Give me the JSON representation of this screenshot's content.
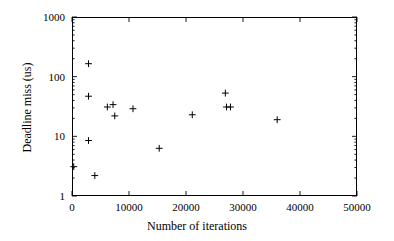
{
  "chart_data": {
    "type": "scatter",
    "title": "",
    "xlabel": "Number of iterations",
    "ylabel": "Deadline miss (us)",
    "xlim": [
      0,
      50000
    ],
    "ylim": [
      1,
      1000
    ],
    "yscale": "log",
    "xscale": "linear",
    "grid": false,
    "legend": null,
    "marker": "plus",
    "marker_color": "#000000",
    "xticks": [
      0,
      10000,
      20000,
      30000,
      40000,
      50000
    ],
    "xtick_labels": [
      "0",
      "10000",
      "20000",
      "30000",
      "40000",
      "50000"
    ],
    "yticks": [
      1,
      10,
      100,
      1000
    ],
    "ytick_labels": [
      "1",
      "10",
      "100",
      "1000"
    ],
    "minor_ticks": true,
    "points": [
      {
        "x": 300,
        "y": 3.1
      },
      {
        "x": 2900,
        "y": 165
      },
      {
        "x": 2900,
        "y": 47
      },
      {
        "x": 2900,
        "y": 8.5
      },
      {
        "x": 4000,
        "y": 2.2
      },
      {
        "x": 6200,
        "y": 31
      },
      {
        "x": 7200,
        "y": 34
      },
      {
        "x": 7500,
        "y": 22
      },
      {
        "x": 10700,
        "y": 29
      },
      {
        "x": 15300,
        "y": 6.3
      },
      {
        "x": 21100,
        "y": 23
      },
      {
        "x": 26900,
        "y": 53
      },
      {
        "x": 27100,
        "y": 31
      },
      {
        "x": 27800,
        "y": 31
      },
      {
        "x": 36000,
        "y": 19
      }
    ]
  },
  "axes": {
    "x_title": "Number of iterations",
    "y_title": "Deadline miss (us)"
  }
}
